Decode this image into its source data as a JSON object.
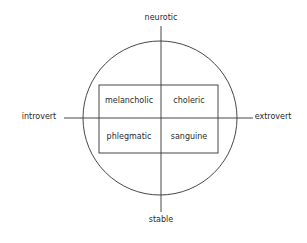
{
  "diagram": {
    "axes": {
      "top": "neurotic",
      "bottom": "stable",
      "left": "introvert",
      "right": "extrovert"
    },
    "quadrants": {
      "top_left": "melancholic",
      "top_right": "choleric",
      "bottom_left": "phlegmatic",
      "bottom_right": "sanguine"
    },
    "colors": {
      "stroke": "#333333",
      "text": "#2a2a2a",
      "background": "#ffffff"
    }
  }
}
